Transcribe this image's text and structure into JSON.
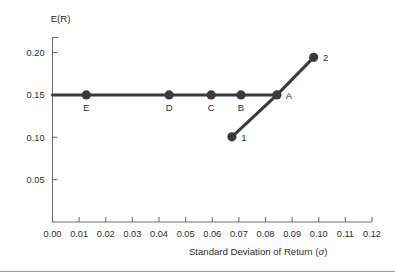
{
  "chart_data": {
    "type": "scatter",
    "title": "",
    "xlabel": "Standard Deviation of Return (σ)",
    "ylabel": "E(R)",
    "xlim": [
      0.0,
      0.12
    ],
    "ylim": [
      0.0,
      0.2178
    ],
    "grid": false,
    "legend": null,
    "xticks": [
      "0.00",
      "0.01",
      "0.02",
      "0.03",
      "0.04",
      "0.05",
      "0.06",
      "0.07",
      "0.08",
      "0.09",
      "0.10",
      "0.11",
      "0.12"
    ],
    "xtick_values": [
      0.0,
      0.01,
      0.02,
      0.03,
      0.04,
      0.05,
      0.06,
      0.07,
      0.08,
      0.09,
      0.1,
      0.11,
      0.12
    ],
    "yticks": [
      "0.05",
      "0.10",
      "0.15",
      "0.20"
    ],
    "ytick_values": [
      0.05,
      0.1,
      0.15,
      0.2
    ],
    "series": [
      {
        "name": "Efficient horizontal line through A",
        "style": "line-with-markers",
        "points": [
          {
            "label": "E",
            "x": 0.0127,
            "y": 0.15,
            "label_pos": "below"
          },
          {
            "label": "D",
            "x": 0.0438,
            "y": 0.15,
            "label_pos": "below"
          },
          {
            "label": "C",
            "x": 0.0596,
            "y": 0.15,
            "label_pos": "below"
          },
          {
            "label": "B",
            "x": 0.0708,
            "y": 0.15,
            "label_pos": "below"
          },
          {
            "label": "A",
            "x": 0.0843,
            "y": 0.15,
            "label_pos": "right"
          }
        ],
        "line_from_x": 0.0,
        "line_to_x": 0.0843
      },
      {
        "name": "Risky asset line through 1, A, 2",
        "style": "line-with-markers",
        "points": [
          {
            "label": "1",
            "x": 0.0674,
            "y": 0.1005,
            "label_pos": "right"
          },
          {
            "label": "A",
            "x": 0.0843,
            "y": 0.15,
            "label_pos": "none"
          },
          {
            "label": "2",
            "x": 0.0981,
            "y": 0.1944,
            "label_pos": "right"
          }
        ]
      }
    ],
    "colors": {
      "line": "#3b3b3d",
      "marker": "#3b3b3d",
      "axis": "#6e6e70",
      "text": "#2b2b2d",
      "background": "#ffffff",
      "rule": "#9a9a9c"
    }
  }
}
